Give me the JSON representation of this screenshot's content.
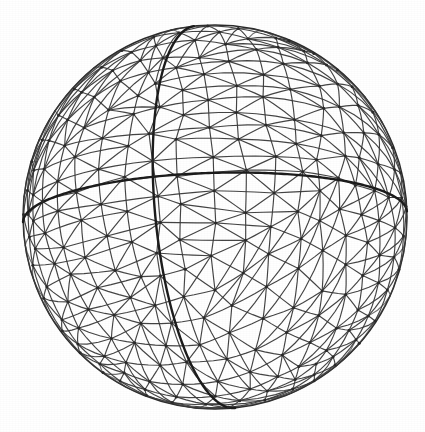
{
  "figure": {
    "background_color": "#ffffff",
    "line_color": "#3a3a3a",
    "bold_line_color": "#1c1c1c",
    "node_color": "#2a2a2a",
    "silhouette_color": "#2b2b2b"
  },
  "geometry": {
    "center_x": 215,
    "center_y": 217,
    "radius": 192,
    "canvas_width": 425,
    "canvas_height": 432,
    "projection": "orthographic",
    "view_rotation_x_deg": -14,
    "view_rotation_y_deg": -18,
    "view_rotation_z_deg": 6
  },
  "mesh": {
    "type": "icosahedral-geodesic-perturbed",
    "subdivision_frequency": 7,
    "jitter": 0.16,
    "random_seed": 20240517,
    "edge_width": 1.15,
    "node_radius": 1.5,
    "visible_hemisphere_only": true
  },
  "great_circles": [
    {
      "name": "meridian",
      "label": "bold vertical meridian",
      "axis": [
        1,
        0,
        0
      ],
      "stroke_width": 2.4
    },
    {
      "name": "equator",
      "label": "bold tilted equator",
      "axis": [
        0,
        1,
        0
      ],
      "stroke_width": 2.4
    }
  ],
  "silhouette": {
    "name": "limb-circle",
    "label": "sphere outline",
    "stroke_width": 1.5
  }
}
